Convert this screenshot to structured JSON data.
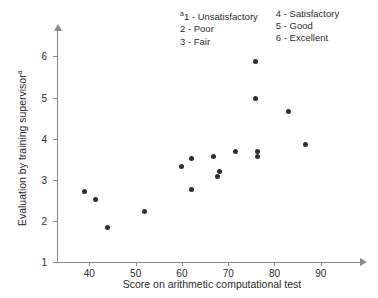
{
  "chart_data": {
    "type": "scatter",
    "title": "",
    "xlabel": "Score on arithmetic computational test",
    "ylabel": "Evaluation by training supervisor",
    "ylabel_superscript": "a",
    "xlim": [
      33,
      100
    ],
    "ylim": [
      1,
      6.4
    ],
    "grid": false,
    "legend_position": "top-right",
    "xticks": [
      40,
      50,
      60,
      70,
      80,
      90
    ],
    "yticks": [
      1,
      2,
      3,
      4,
      5,
      6
    ],
    "points": [
      {
        "x": 38.9,
        "y": 2.72
      },
      {
        "x": 41.4,
        "y": 2.52
      },
      {
        "x": 44.0,
        "y": 1.85
      },
      {
        "x": 51.9,
        "y": 2.24
      },
      {
        "x": 60.0,
        "y": 3.33
      },
      {
        "x": 62.0,
        "y": 3.52
      },
      {
        "x": 62.0,
        "y": 2.76
      },
      {
        "x": 66.8,
        "y": 3.57
      },
      {
        "x": 67.7,
        "y": 3.08
      },
      {
        "x": 68.1,
        "y": 3.2
      },
      {
        "x": 71.6,
        "y": 3.7
      },
      {
        "x": 76.4,
        "y": 3.7
      },
      {
        "x": 76.0,
        "y": 5.88
      },
      {
        "x": 76.0,
        "y": 4.97
      },
      {
        "x": 76.4,
        "y": 3.57
      },
      {
        "x": 83.0,
        "y": 4.65
      },
      {
        "x": 86.7,
        "y": 3.87
      }
    ],
    "marker_color": "#2e2e2e",
    "axis_color": "#8a8a8a"
  },
  "legend": {
    "superscript": "a",
    "columns": [
      {
        "items": [
          "1 - Unsatisfactory",
          "2 - Poor",
          "3 - Fair"
        ]
      },
      {
        "items": [
          "4 - Satisfactory",
          "5 - Good",
          "6 - Excellent"
        ]
      }
    ]
  }
}
